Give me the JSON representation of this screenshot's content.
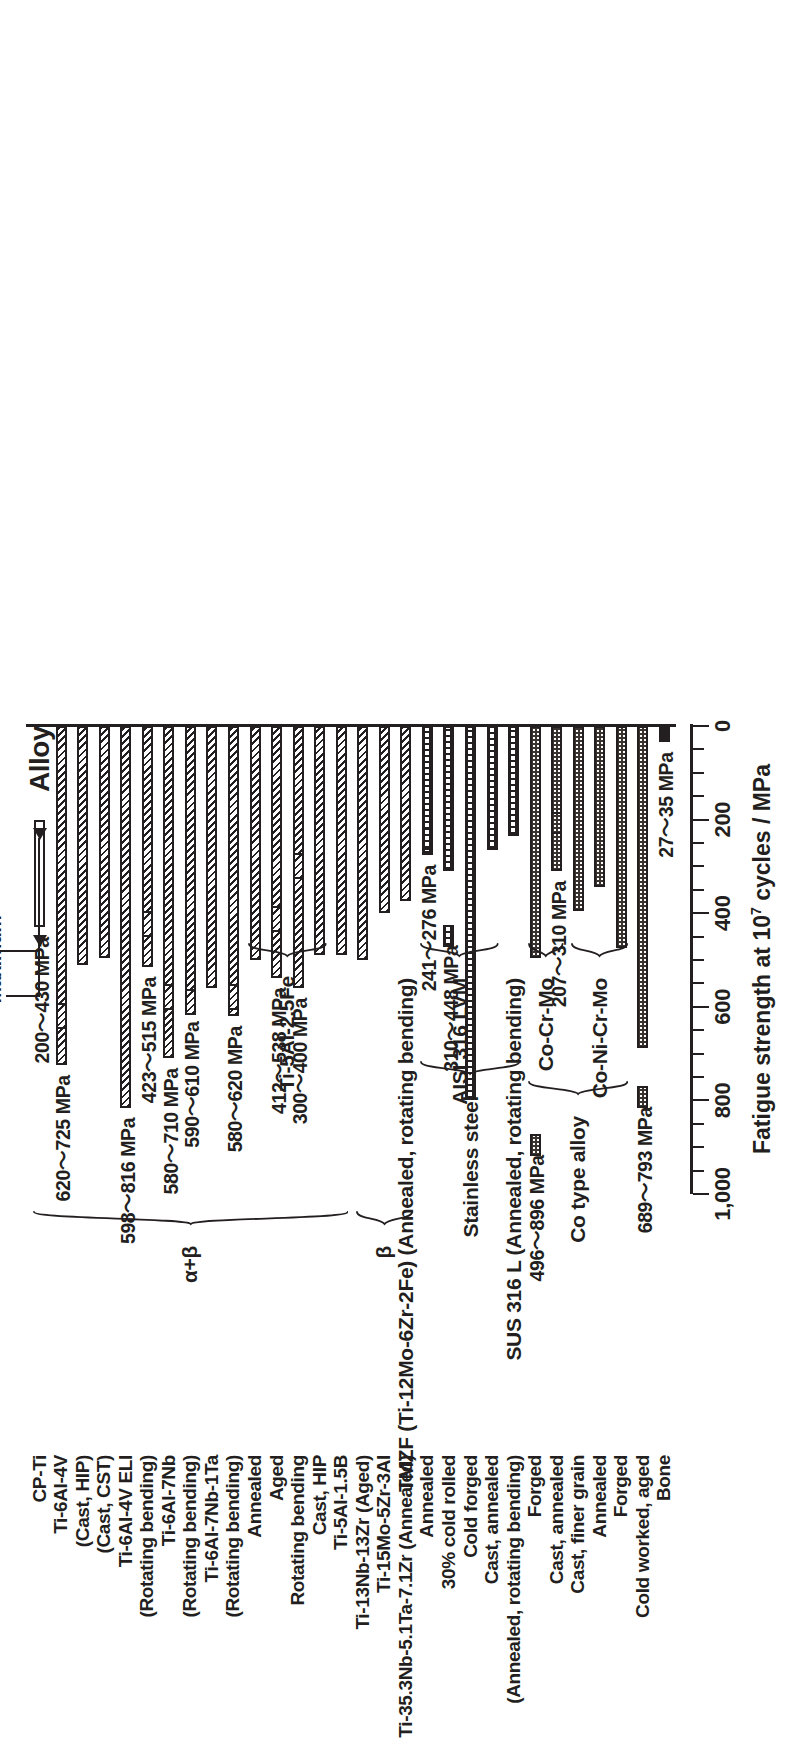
{
  "chart_data": {
    "type": "bar",
    "orientation": "vertical-rotated",
    "title": "",
    "xlabel": "Alloy",
    "ylabel": "Fatigue strength at 10⁷ cycles / MPa",
    "ylim": [
      0,
      1000
    ],
    "yticks": [
      0,
      200,
      400,
      600,
      800,
      1000
    ],
    "ytick_labels": [
      "0",
      "200",
      "400",
      "600",
      "800",
      "1,000"
    ],
    "minor_tick_step": 50,
    "grid": false,
    "legend_position": "top-left",
    "value_note": "Each bar spans the minimum to maximum reported fatigue strength",
    "categories": [
      "CP-Ti",
      "Ti-6Al-4V (Cast, HIP)",
      "Ti-6Al-4V (Cast, CST)",
      "Ti-6Al-4V ELI (Rotating bending)",
      "Ti-6Al-7Nb",
      "Ti-6Al-7Nb (Rotating bending)",
      "Ti-6Al-7Nb-1Ta",
      "Ti-6Al-7Nb-1Ta (Rotating bending)",
      "Ti-5Al-2.5Fe Annealed",
      "Ti-5Al-2.5Fe Aged",
      "Ti-5Al-2.5Fe Rotating bending",
      "Ti-5Al-2.5Fe Cast, HIP",
      "Ti-5Al-1.5B",
      "TMZF (Ti-12Mo-6Zr-2Fe) (Annealed, rotating bending)",
      "Ti-13Nb-13Zr (Aged)",
      "Ti-15Mo-5Zr-3Al",
      "Ti-35.3Nb-5.1Ta-7.1Zr (Annealed)",
      "AISI 316 LVM Annealed",
      "AISI 316 LVM 30% cold rolled",
      "AISI 316 LVM Cold forged",
      "AISI 316 LVM Cast, annealed",
      "SUS 316 L (Annealed, rotating bending)",
      "Co-Cr-Mo Forged",
      "Co-Cr-Mo Cast, annealed",
      "Co-Cr-Mo Cast, finer grain",
      "Co-Ni-Cr-Mo Annealed",
      "Co-Ni-Cr-Mo Forged",
      "Co-Ni-Cr-Mo Cold worked, aged",
      "Bone"
    ],
    "series": [
      {
        "name": "Minimum",
        "values": [
          200,
          620,
          0,
          0,
          423,
          580,
          0,
          590,
          0,
          580,
          300,
          412,
          0,
          0,
          0,
          0,
          0,
          241,
          310,
          0,
          0,
          0,
          0,
          207,
          0,
          0,
          0,
          689,
          27
        ]
      },
      {
        "name": "Maximum",
        "values": [
          430,
          725,
          500,
          816,
          515,
          710,
          550,
          610,
          620,
          620,
          400,
          538,
          490,
          490,
          0,
          400,
          380,
          276,
          310,
          800,
          260,
          0,
          496,
          310,
          380,
          340,
          470,
          793,
          35
        ]
      }
    ],
    "bars": [
      {
        "label": "CP-Ti",
        "min": 200,
        "max": 430,
        "value_label": "200～430 MPa",
        "pattern": "open",
        "group": "alpha_beta"
      },
      {
        "label": "Ti-6Al-4V",
        "min": 0,
        "max": 725,
        "value_label": "620～725 MPa",
        "pattern": "hatch",
        "group": "alpha_beta",
        "marker_min": 620
      },
      {
        "label": "(Cast, HIP)",
        "min": 0,
        "max": 510,
        "value_label": "",
        "pattern": "hatch",
        "group": "alpha_beta"
      },
      {
        "label": "(Cast, CST)",
        "min": 0,
        "max": 495,
        "value_label": "",
        "pattern": "hatch",
        "group": "alpha_beta"
      },
      {
        "label": "Ti-6Al-4V ELI",
        "min": 0,
        "max": 816,
        "value_label": "598～816 MPa",
        "pattern": "hatch",
        "group": "alpha_beta"
      },
      {
        "label": "(Rotating bending)",
        "min": 0,
        "max": 515,
        "value_label": "423～515 MPa",
        "pattern": "hatch",
        "group": "alpha_beta",
        "marker_min": 423
      },
      {
        "label": "Ti-6Al-7Nb",
        "min": 0,
        "max": 710,
        "value_label": "580～710 MPa",
        "pattern": "hatch",
        "group": "alpha_beta",
        "marker_min": 580
      },
      {
        "label": "(Rotating bending)",
        "min": 0,
        "max": 610,
        "value_label": "590～610 MPa",
        "pattern": "hatch",
        "group": "alpha_beta",
        "marker_min": 590
      },
      {
        "label": "Ti-6Al-7Nb-1Ta",
        "min": 0,
        "max": 560,
        "value_label": "",
        "pattern": "hatch",
        "group": "alpha_beta"
      },
      {
        "label": "(Rotating bending)",
        "min": 0,
        "max": 620,
        "value_label": "580～620 MPa",
        "pattern": "hatch",
        "group": "alpha_beta",
        "marker_min": 580
      },
      {
        "label": "Annealed",
        "min": 0,
        "max": 500,
        "value_label": "",
        "pattern": "hatch",
        "group": "ti5al25fe"
      },
      {
        "label": "Aged",
        "min": 0,
        "max": 538,
        "value_label": "412～538 MPa",
        "pattern": "hatch",
        "group": "ti5al25fe",
        "marker_min": 412
      },
      {
        "label": "Rotating bending",
        "min": 0,
        "max": 560,
        "value_label": "300～400 MPa",
        "pattern": "hatch",
        "group": "ti5al25fe",
        "marker_min": 300
      },
      {
        "label": "Cast, HIP",
        "min": 0,
        "max": 490,
        "value_label": "",
        "pattern": "hatch",
        "group": "ti5al25fe"
      },
      {
        "label": "Ti-5Al-1.5B",
        "min": 0,
        "max": 490,
        "value_label": "",
        "pattern": "hatch",
        "group": "alpha_beta"
      },
      {
        "label": "Ti-13Nb-13Zr (Aged)",
        "min": 0,
        "max": 500,
        "value_label": "",
        "pattern": "hatch",
        "group": "beta"
      },
      {
        "label": "Ti-15Mo-5Zr-3Al",
        "min": 0,
        "max": 400,
        "value_label": "",
        "pattern": "hatch",
        "group": "beta"
      },
      {
        "label": "Ti-35.3Nb-5.1Ta-7.1Zr",
        "min": 0,
        "max": 375,
        "value_label": "",
        "pattern": "hatch",
        "group": "beta"
      },
      {
        "label": "Annealed",
        "min": 0,
        "max": 276,
        "value_label": "241～276 MPa",
        "pattern": "grid",
        "group": "stainless",
        "marker_min": 241
      },
      {
        "label": "30% cold rolled",
        "min": 0,
        "max": 310,
        "value_label": "310～448 MPa",
        "pattern": "grid",
        "group": "stainless",
        "marker_min": 448
      },
      {
        "label": "Cold forged",
        "min": 0,
        "max": 800,
        "value_label": "",
        "pattern": "grid",
        "group": "stainless"
      },
      {
        "label": "Cast, annealed",
        "min": 0,
        "max": 265,
        "value_label": "",
        "pattern": "grid",
        "group": "stainless"
      },
      {
        "label": "(Annealed, rot. bend.)",
        "min": 0,
        "max": 235,
        "value_label": "",
        "pattern": "grid",
        "group": "stainless"
      },
      {
        "label": "Forged",
        "min": 0,
        "max": 496,
        "value_label": "496～896 MPa",
        "pattern": "dot",
        "group": "co",
        "marker_min": 896
      },
      {
        "label": "Cast, annealed",
        "min": 0,
        "max": 310,
        "value_label": "207～310 MPa",
        "pattern": "dot",
        "group": "co",
        "marker_min": 207
      },
      {
        "label": "Cast, finer grain",
        "min": 0,
        "max": 395,
        "value_label": "",
        "pattern": "dot",
        "group": "co"
      },
      {
        "label": "Annealed",
        "min": 0,
        "max": 345,
        "value_label": "",
        "pattern": "dot",
        "group": "co"
      },
      {
        "label": "Forged",
        "min": 0,
        "max": 475,
        "value_label": "",
        "pattern": "dot",
        "group": "co"
      },
      {
        "label": "Cold worked, aged",
        "min": 0,
        "max": 689,
        "value_label": "689～793 MPa",
        "pattern": "dot",
        "group": "co",
        "marker_min": 793
      },
      {
        "label": "Bone",
        "min": 0,
        "max": 35,
        "value_label": "27～35 MPa",
        "pattern": "solid",
        "group": "bone"
      }
    ]
  },
  "axes": {
    "category_axis_title": "Alloy",
    "value_axis_title_parts": {
      "pre": "Fatigue strength at 10",
      "sup": "7",
      "post": " cycles / MPa"
    },
    "tick_labels": [
      "0",
      "200",
      "400",
      "600",
      "800",
      "1,000"
    ]
  },
  "legend": {
    "minimum_label": "Minimum",
    "maximum_label": "Maximum"
  },
  "category_labels": [
    "CP-Ti",
    "Ti-6Al-4V",
    "(Cast, HIP)",
    "(Cast, CST)",
    "Ti-6Al-4V ELI",
    "(Rotating bending)",
    "Ti-6Al-7Nb",
    "(Rotating bending)",
    "Ti-6Al-7Nb-1Ta",
    "(Rotating bending)",
    "Annealed",
    "Aged",
    "Rotating bending",
    "Cast, HIP",
    "Ti-5Al-1.5B",
    "Ti-13Nb-13Zr (Aged)",
    "Ti-15Mo-5Zr-3Al",
    "Ti-35.3Nb-5.1Ta-7.1Zr (Annealed)",
    "Annealed",
    "30% cold rolled",
    "Cold forged",
    "Cast, annealed",
    "(Annealed, rotating bending)",
    "Forged",
    "Cast, annealed",
    "Cast, finer grain",
    "Annealed",
    "Forged",
    "Cold worked, aged",
    "Bone"
  ],
  "group_labels": {
    "alpha_beta": "α+β",
    "beta": "β",
    "ti5al25fe": "Ti-5Al-2.5Fe",
    "tmzf": "TMZF (Ti-12Mo-6Zr-2Fe) (Annealed, rotating bending)",
    "stainless": "Stainless steel",
    "aisi": "AISI 316 LVM",
    "sus": "SUS 316 L (Annealed, rotating bending)",
    "co_type": "Co type alloy",
    "cocrmo": "Co-Cr-Mo",
    "conicrmo": "Co-Ni-Cr-Mo"
  },
  "value_labels": [
    "200～430 MPa",
    "620～725 MPa",
    "598～816 MPa",
    "423～515 MPa",
    "580～710 MPa",
    "590～610 MPa",
    "580～620 MPa",
    "412～538 MPa",
    "300～400 MPa",
    "241～276 MPa",
    "310～448 MPa",
    "496～896 MPa",
    "207～310 MPa",
    "689～793 MPa",
    "27～35 MPa"
  ],
  "colors": {
    "ink": "#231f20",
    "paper": "#ffffff",
    "co_fill": "#3a3330"
  }
}
